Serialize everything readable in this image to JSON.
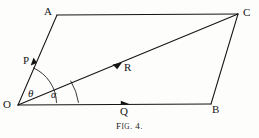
{
  "figure": {
    "caption_lead": "F",
    "caption_small": "IG",
    "caption_tail": ". 4.",
    "caption_full": "FIG. 4.",
    "background_color": "#fdfdfc",
    "ink_color": "#151515"
  },
  "vertices": {
    "O": {
      "label": "O",
      "x": 18,
      "y": 105
    },
    "A": {
      "label": "A",
      "x": 57,
      "y": 15
    },
    "B": {
      "label": "B",
      "x": 211,
      "y": 104
    },
    "C": {
      "label": "C",
      "x": 238,
      "y": 14
    }
  },
  "vectors": {
    "P": {
      "label": "P",
      "description": "vector from O toward A"
    },
    "Q": {
      "label": "Q",
      "description": "vector from O toward B"
    },
    "R": {
      "label": "R",
      "description": "resultant vector from O toward C"
    }
  },
  "angles": {
    "theta": {
      "label": "θ",
      "description": "angle between Q and P"
    },
    "alpha": {
      "label": "α",
      "description": "angle between Q and R"
    }
  },
  "segments": [
    {
      "name": "O-A",
      "from": "O",
      "to": "A"
    },
    {
      "name": "A-C",
      "from": "A",
      "to": "C"
    },
    {
      "name": "O-B",
      "from": "O",
      "to": "B"
    },
    {
      "name": "B-C",
      "from": "B",
      "to": "C"
    },
    {
      "name": "O-C",
      "from": "O",
      "to": "C"
    }
  ]
}
